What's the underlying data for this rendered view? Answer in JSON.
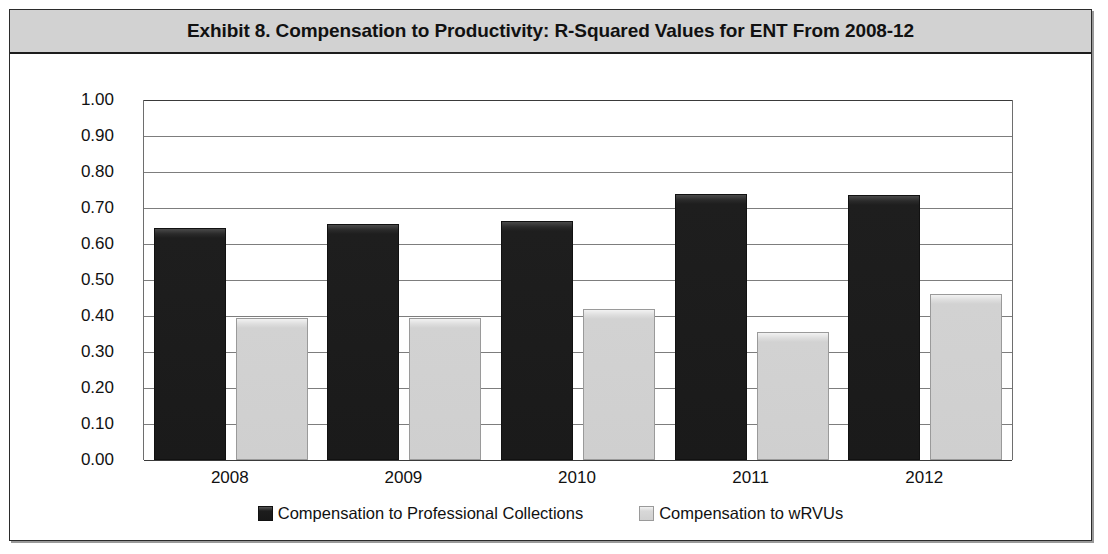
{
  "exhibit": {
    "title": "Exhibit 8. Compensation to Productivity: R-Squared Values for ENT From 2008-12"
  },
  "colors": {
    "title_bar_background": "#d2d2d2",
    "frame_border": "#2b2b2b",
    "series_dark": "#1a1a1a",
    "series_light": "#d0d0d0",
    "gridline": "#7d7d7d",
    "text": "#111111"
  },
  "legend": {
    "position": "bottom",
    "items": [
      {
        "label": "Compensation to Professional Collections",
        "swatch": "dark"
      },
      {
        "label": "Compensation to wRVUs",
        "swatch": "light"
      }
    ]
  },
  "axis": {
    "y_ticks": [
      "1.00",
      "0.90",
      "0.80",
      "0.70",
      "0.60",
      "0.50",
      "0.40",
      "0.30",
      "0.20",
      "0.10",
      "0.00"
    ],
    "x_ticks": [
      "2008",
      "2009",
      "2010",
      "2011",
      "2012"
    ]
  },
  "chart_data": {
    "type": "bar",
    "title": "Exhibit 8. Compensation to Productivity: R-Squared Values for ENT From 2008-12",
    "xlabel": "",
    "ylabel": "",
    "ylim": [
      0.0,
      1.0
    ],
    "ytick_step": 0.1,
    "grid": true,
    "legend_position": "bottom",
    "categories": [
      "2008",
      "2009",
      "2010",
      "2011",
      "2012"
    ],
    "series": [
      {
        "name": "Compensation to Professional Collections",
        "color": "#1a1a1a",
        "values": [
          0.645,
          0.655,
          0.665,
          0.74,
          0.735
        ]
      },
      {
        "name": "Compensation to wRVUs",
        "color": "#d0d0d0",
        "values": [
          0.395,
          0.395,
          0.42,
          0.355,
          0.46
        ]
      }
    ]
  }
}
